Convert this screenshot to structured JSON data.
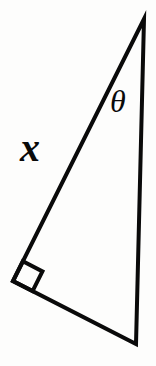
{
  "figure": {
    "kind": "geometry-diagram",
    "shape": "right-triangle",
    "background_color": "#fdfdfc",
    "stroke_color": "#0a0a0a",
    "stroke_width_px": 4
  },
  "labels": {
    "side_label": "x",
    "angle_label": "θ"
  },
  "geometry": {
    "vertices": {
      "apex": {
        "x": 144,
        "y": 19
      },
      "right_angle": {
        "x": 13,
        "y": 281
      },
      "bottom_right": {
        "x": 136,
        "y": 344
      }
    },
    "right_angle_marker": {
      "present": true,
      "size_px": 22
    },
    "edges": [
      {
        "name": "hypotenuse",
        "from": "apex",
        "to": "right_angle",
        "label": "x"
      },
      {
        "name": "vertical-side",
        "from": "apex",
        "to": "bottom_right",
        "label": ""
      },
      {
        "name": "base",
        "from": "right_angle",
        "to": "bottom_right",
        "label": ""
      }
    ]
  }
}
